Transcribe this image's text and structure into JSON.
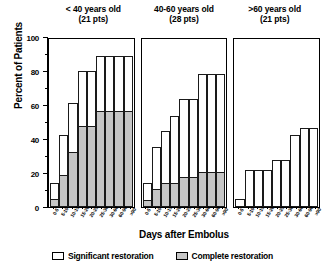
{
  "chart_data": {
    "type": "bar",
    "title": "",
    "xlabel": "Days after Embolus",
    "ylabel": "Percent of Patients",
    "ylim": [
      0,
      100
    ],
    "yticks": [
      0,
      20,
      40,
      60,
      80,
      100
    ],
    "ytick_labels": [
      "0",
      "20",
      "40",
      "60",
      "80",
      "100"
    ],
    "yminor_ticks": [
      10,
      30,
      50,
      70,
      90
    ],
    "grid": false,
    "legend_position": "bottom",
    "categories": [
      "0-5",
      "5-10",
      "10-15",
      "15-20",
      "20-25",
      "25-30",
      "30-60",
      "60-90",
      ">90"
    ],
    "legend": [
      {
        "label": "Significant restoration",
        "color": "#ffffff"
      },
      {
        "label": "Complete restoration",
        "color": "#c6c6c6"
      }
    ],
    "panels": [
      {
        "title_line1": "< 40 years old",
        "title_line2": "(21 pts)",
        "series": [
          {
            "name": "Significant restoration",
            "values": [
              14,
              43,
              62,
              81,
              81,
              90,
              90,
              90,
              90
            ]
          },
          {
            "name": "Complete restoration",
            "values": [
              5,
              19,
              33,
              48,
              48,
              57,
              57,
              57,
              57
            ]
          }
        ]
      },
      {
        "title_line1": "40-60 years old",
        "title_line2": "(28 pts)",
        "series": [
          {
            "name": "Significant restoration",
            "values": [
              14,
              36,
              45,
              54,
              64,
              64,
              79,
              79,
              79
            ]
          },
          {
            "name": "Complete restoration",
            "values": [
              4,
              11,
              14,
              14,
              18,
              18,
              21,
              21,
              21
            ]
          }
        ]
      },
      {
        "title_line1": ">60 years old",
        "title_line2": "(21 pts)",
        "series": [
          {
            "name": "Significant restoration",
            "values": [
              5,
              22,
              22,
              22,
              28,
              28,
              43,
              47,
              47
            ]
          },
          {
            "name": "Complete restoration",
            "values": [
              0,
              0,
              0,
              0,
              0,
              0,
              0,
              0,
              0
            ]
          }
        ]
      }
    ]
  }
}
